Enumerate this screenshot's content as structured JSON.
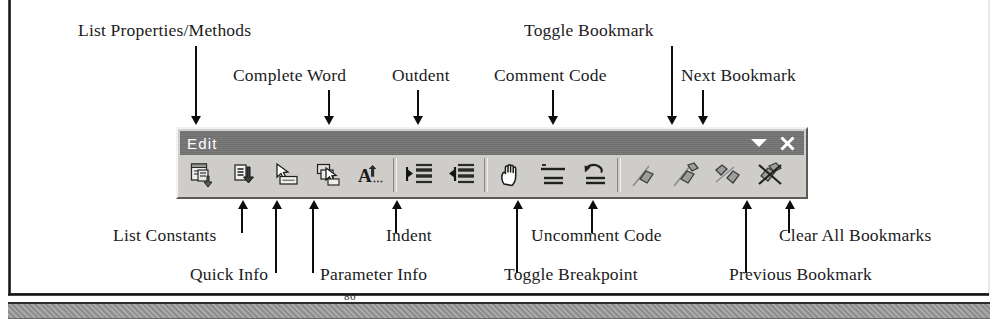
{
  "figure": {
    "page_number": "86"
  },
  "toolbar": {
    "title": "Edit",
    "dropdown_icon": "chevron-down-icon",
    "close_icon": "close-icon",
    "buttons": [
      {
        "id": "list-properties-methods",
        "name": "list-properties-methods-button",
        "tooltip": "List Properties/Methods"
      },
      {
        "id": "list-constants",
        "name": "list-constants-button",
        "tooltip": "List Constants"
      },
      {
        "id": "quick-info",
        "name": "quick-info-button",
        "tooltip": "Quick Info"
      },
      {
        "id": "parameter-info",
        "name": "parameter-info-button",
        "tooltip": "Parameter Info"
      },
      {
        "id": "complete-word",
        "name": "complete-word-button",
        "tooltip": "Complete Word"
      },
      {
        "id": "indent",
        "name": "indent-button",
        "tooltip": "Indent"
      },
      {
        "id": "outdent",
        "name": "outdent-button",
        "tooltip": "Outdent"
      },
      {
        "id": "toggle-breakpoint",
        "name": "toggle-breakpoint-button",
        "tooltip": "Toggle Breakpoint"
      },
      {
        "id": "comment-code",
        "name": "comment-code-button",
        "tooltip": "Comment Code"
      },
      {
        "id": "uncomment-code",
        "name": "uncomment-code-button",
        "tooltip": "Uncomment Code"
      },
      {
        "id": "toggle-bookmark",
        "name": "toggle-bookmark-button",
        "tooltip": "Toggle Bookmark"
      },
      {
        "id": "next-bookmark",
        "name": "next-bookmark-button",
        "tooltip": "Next Bookmark"
      },
      {
        "id": "previous-bookmark",
        "name": "previous-bookmark-button",
        "tooltip": "Previous Bookmark"
      },
      {
        "id": "clear-all-bookmarks",
        "name": "clear-all-bookmarks-button",
        "tooltip": "Clear All Bookmarks"
      }
    ]
  },
  "callouts": {
    "above": [
      {
        "id": "list-properties-methods",
        "text": "List Properties/Methods"
      },
      {
        "id": "complete-word",
        "text": "Complete Word"
      },
      {
        "id": "outdent",
        "text": "Outdent"
      },
      {
        "id": "comment-code",
        "text": "Comment Code"
      },
      {
        "id": "toggle-bookmark",
        "text": "Toggle Bookmark"
      },
      {
        "id": "next-bookmark",
        "text": "Next Bookmark"
      }
    ],
    "below": [
      {
        "id": "list-constants",
        "text": "List Constants"
      },
      {
        "id": "indent",
        "text": "Indent"
      },
      {
        "id": "uncomment-code",
        "text": "Uncomment Code"
      },
      {
        "id": "clear-all-bookmarks",
        "text": "Clear All Bookmarks"
      },
      {
        "id": "quick-info",
        "text": "Quick Info"
      },
      {
        "id": "parameter-info",
        "text": "Parameter Info"
      },
      {
        "id": "toggle-breakpoint",
        "text": "Toggle Breakpoint"
      },
      {
        "id": "previous-bookmark",
        "text": "Previous Bookmark"
      }
    ]
  },
  "colors": {
    "titlebar": "#737373",
    "toolbar_face": "#cfcdc9",
    "ink": "#1b1b22",
    "leader": "#0d0d0d"
  }
}
